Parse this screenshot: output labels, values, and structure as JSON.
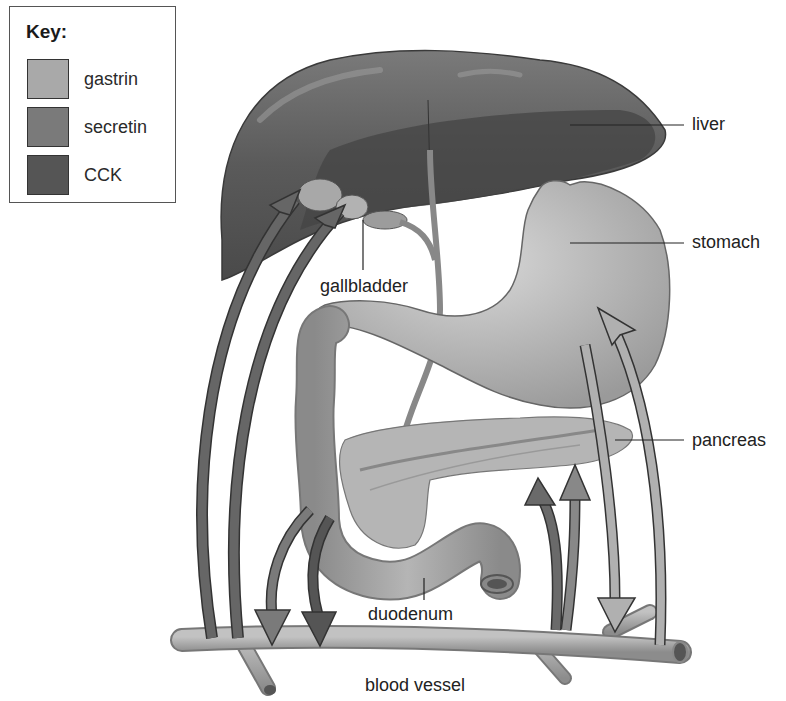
{
  "key": {
    "title": "Key:",
    "items": [
      {
        "label": "gastrin",
        "color": "#a9a9a9"
      },
      {
        "label": "secretin",
        "color": "#7a7a7a"
      },
      {
        "label": "CCK",
        "color": "#555555"
      }
    ]
  },
  "labels": {
    "liver": "liver",
    "stomach": "stomach",
    "pancreas": "pancreas",
    "gallbladder": "gallbladder",
    "duodenum": "duodenum",
    "blood_vessel": "blood vessel"
  },
  "colors": {
    "liver": "#5e5e5e",
    "liver_dark": "#3f3f3f",
    "stomach": "#bdbdbd",
    "intestine": "#9c9c9c",
    "pancreas": "#b0b0b0",
    "vessel": "#a4a4a4",
    "gastrin": "#a9a9a9",
    "secretin": "#7a7a7a",
    "cck": "#555555"
  }
}
